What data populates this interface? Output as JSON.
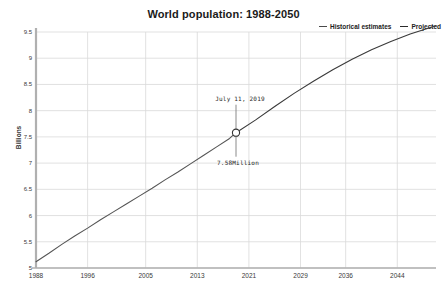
{
  "chart_data": {
    "type": "line",
    "title": "World population: 1988-2050",
    "xlabel": "",
    "ylabel": "Billions",
    "xlim": [
      1988,
      2050
    ],
    "ylim": [
      5,
      9.5
    ],
    "grid": true,
    "legend_position": "top-right",
    "x_ticks": [
      "1988",
      "1996",
      "2005",
      "2013",
      "2021",
      "2029",
      "2036",
      "2044"
    ],
    "x_tick_values": [
      1988,
      1996,
      2005,
      2013,
      2021,
      2029,
      2036,
      2044
    ],
    "y_ticks": [
      "5",
      "5.5",
      "6",
      "6.5",
      "7",
      "7.5",
      "8",
      "8.5",
      "9",
      "9.5"
    ],
    "y_tick_values": [
      5,
      5.5,
      6,
      6.5,
      7,
      7.5,
      8,
      8.5,
      9,
      9.5
    ],
    "series": [
      {
        "name": "Historical estimates",
        "color": "#555555",
        "x": [
          1988,
          1990,
          1992,
          1994,
          1996,
          1998,
          2000,
          2002,
          2004,
          2006,
          2008,
          2010,
          2012,
          2014,
          2016,
          2018,
          2019
        ],
        "values": [
          5.12,
          5.28,
          5.45,
          5.61,
          5.76,
          5.92,
          6.07,
          6.22,
          6.37,
          6.52,
          6.68,
          6.83,
          6.99,
          7.15,
          7.31,
          7.47,
          7.58
        ]
      },
      {
        "name": "Projected",
        "color": "#3a3a3a",
        "x": [
          2019,
          2022,
          2025,
          2028,
          2031,
          2034,
          2037,
          2040,
          2043,
          2046,
          2050
        ],
        "values": [
          7.58,
          7.82,
          8.08,
          8.33,
          8.56,
          8.78,
          8.98,
          9.16,
          9.32,
          9.46,
          9.62
        ]
      }
    ],
    "annotation": {
      "date_label": "July 11, 2019",
      "value_label": "7.58Million",
      "point_x": 2019,
      "point_y": 7.58
    }
  },
  "legend": {
    "items": [
      {
        "label": "Historical estimates"
      },
      {
        "label": "Projected"
      }
    ]
  }
}
